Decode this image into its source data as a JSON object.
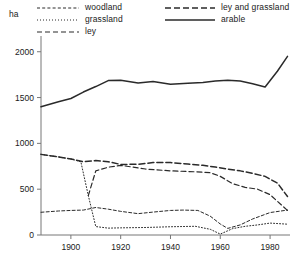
{
  "axis_unit_label": "ha",
  "legend": {
    "entries": [
      {
        "id": "woodland",
        "label": "woodland",
        "style": "short-dash"
      },
      {
        "id": "grassland",
        "label": "grassland",
        "style": "fine-dot"
      },
      {
        "id": "ley",
        "label": "ley",
        "style": "medium-dash"
      },
      {
        "id": "ley_and_grassland",
        "label": "ley and grassland",
        "style": "long-dash"
      },
      {
        "id": "arable",
        "label": "arable",
        "style": "solid"
      }
    ]
  },
  "chart_data": {
    "type": "line",
    "title": "",
    "xlabel": "",
    "ylabel": "ha",
    "xlim": [
      1888,
      1988
    ],
    "ylim": [
      0,
      2150
    ],
    "xticks": [
      1900,
      1920,
      1940,
      1960,
      1980
    ],
    "xtick_labels": [
      "1900",
      "1920",
      "1940",
      "1960",
      "1980"
    ],
    "yticks": [
      0,
      500,
      1000,
      1500,
      2000
    ],
    "ytick_labels": [
      "0",
      "500",
      "1000",
      "1500",
      "2000"
    ],
    "grid": false,
    "legend_position": "top",
    "series": [
      {
        "name": "woodland",
        "style": "short-dash",
        "x": [
          1888,
          1895,
          1900,
          1905,
          1910,
          1915,
          1920,
          1927,
          1933,
          1940,
          1945,
          1951,
          1956,
          1960,
          1963,
          1968,
          1973,
          1980,
          1987
        ],
        "values": [
          248,
          262,
          268,
          272,
          300,
          282,
          258,
          233,
          250,
          268,
          272,
          268,
          205,
          120,
          72,
          110,
          175,
          245,
          272
        ]
      },
      {
        "name": "grassland",
        "style": "fine-dot",
        "x": [
          1888,
          1895,
          1900,
          1904,
          1907,
          1910,
          1915,
          1920,
          1930,
          1940,
          1950,
          1956,
          1960,
          1965,
          1970,
          1975,
          1980,
          1987
        ],
        "values": [
          880,
          852,
          830,
          800,
          430,
          92,
          75,
          78,
          82,
          90,
          95,
          62,
          10,
          70,
          95,
          110,
          130,
          118
        ]
      },
      {
        "name": "ley",
        "style": "medium-dash",
        "x": [
          1907,
          1910,
          1915,
          1920,
          1930,
          1940,
          1950,
          1956,
          1960,
          1965,
          1970,
          1975,
          1980,
          1987
        ],
        "values": [
          430,
          700,
          740,
          760,
          720,
          700,
          690,
          680,
          640,
          560,
          520,
          500,
          440,
          268
        ]
      },
      {
        "name": "ley and grassland",
        "style": "long-dash",
        "x": [
          1888,
          1895,
          1900,
          1905,
          1910,
          1915,
          1920,
          1927,
          1933,
          1940,
          1947,
          1953,
          1958,
          1963,
          1968,
          1973,
          1978,
          1983,
          1987
        ],
        "values": [
          880,
          852,
          830,
          800,
          812,
          800,
          770,
          772,
          790,
          790,
          775,
          760,
          742,
          720,
          700,
          672,
          640,
          565,
          420
        ]
      },
      {
        "name": "arable",
        "style": "solid",
        "x": [
          1888,
          1895,
          1900,
          1905,
          1910,
          1915,
          1920,
          1927,
          1933,
          1940,
          1947,
          1953,
          1958,
          1963,
          1968,
          1973,
          1978,
          1983,
          1987
        ],
        "values": [
          1400,
          1455,
          1490,
          1560,
          1620,
          1685,
          1690,
          1660,
          1675,
          1645,
          1655,
          1665,
          1680,
          1690,
          1680,
          1650,
          1615,
          1790,
          1950
        ]
      }
    ]
  }
}
